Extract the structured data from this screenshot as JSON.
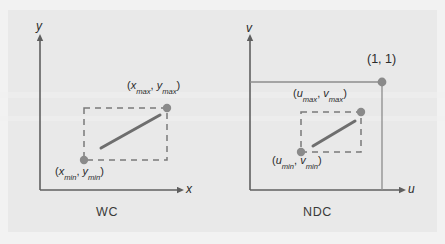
{
  "figure": {
    "background_color": "#e9e9e9",
    "line_color": "#6b6b6b",
    "dash_color": "#7a7a7a",
    "dot_color": "#8a8a8a",
    "segment_color": "#6e6e6e",
    "text_color": "#2b2b2b"
  },
  "panels": [
    {
      "id": "wc",
      "caption": "WC",
      "axes": {
        "x_label": "x",
        "y_label": "y"
      },
      "window": {
        "style": "dashed",
        "min_label_parts": {
          "open": "(",
          "x": "x",
          "x_sub": "min",
          "comma": ", ",
          "y": "y",
          "y_sub": "min",
          "close": ")"
        },
        "max_label_parts": {
          "open": "(",
          "x": "x",
          "x_sub": "max",
          "comma": ", ",
          "y": "y",
          "y_sub": "max",
          "close": ")"
        },
        "min_label": "(xmin, ymin)",
        "max_label": "(xmax, ymax)"
      },
      "object": {
        "type": "line-segment"
      }
    },
    {
      "id": "ndc",
      "caption": "NDC",
      "axes": {
        "x_label": "u",
        "y_label": "v"
      },
      "unit_square": {
        "style": "solid",
        "corner_label": "(1, 1)"
      },
      "viewport": {
        "style": "dashed",
        "min_label_parts": {
          "open": "(",
          "x": "u",
          "x_sub": "min",
          "comma": ", ",
          "y": "v",
          "y_sub": "min",
          "close": ")"
        },
        "max_label_parts": {
          "open": "(",
          "x": "u",
          "x_sub": "max",
          "comma": ", ",
          "y": "v",
          "y_sub": "max",
          "close": ")"
        },
        "min_label": "(umin, vmin)",
        "max_label": "(umax, vmax)"
      },
      "object": {
        "type": "line-segment"
      }
    }
  ]
}
